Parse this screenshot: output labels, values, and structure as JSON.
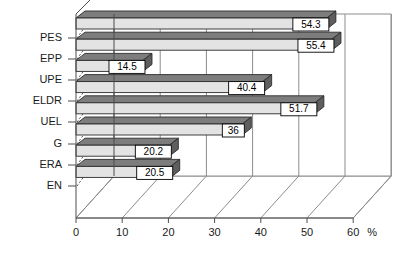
{
  "chart_data": {
    "type": "bar",
    "orientation": "horizontal",
    "title": "",
    "subtitle": "",
    "xlabel": "",
    "ylabel": "",
    "unit": "%",
    "xlim": [
      0,
      60
    ],
    "xticks": [
      0,
      10,
      20,
      30,
      40,
      50,
      60
    ],
    "xtick_labels": [
      "0",
      "10",
      "20",
      "30",
      "40",
      "50",
      "60"
    ],
    "categories": [
      "PES",
      "EPP",
      "UPE",
      "ELDR",
      "UEL",
      "G",
      "ERA",
      "EN"
    ],
    "values": [
      54.3,
      55.4,
      14.5,
      40.4,
      51.7,
      36,
      20.2,
      20.5
    ],
    "value_labels": [
      "54.3",
      "55.4",
      "14.5",
      "40.4",
      "51.7",
      "36",
      "20.2",
      "20.5"
    ],
    "grid": true,
    "grid_axis": "x",
    "legend": false,
    "legend_position": "none",
    "three_d": true,
    "series": [
      {
        "name": "",
        "values": [
          54.3,
          55.4,
          14.5,
          40.4,
          51.7,
          36,
          20.2,
          20.5
        ]
      }
    ]
  },
  "colors": {
    "bar_top": "#7d7d7d",
    "bar_front": "#e3e3e3",
    "bar_side": "#5e5e5e",
    "background": "#ffffff",
    "grid": "#8c8c8c",
    "axis": "#4d4d4d",
    "text": "#1a1a1a",
    "label_box_fill": "#ffffff",
    "label_box_stroke": "#000000"
  }
}
